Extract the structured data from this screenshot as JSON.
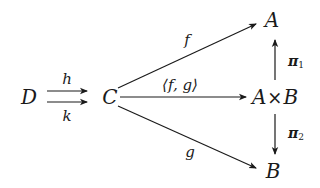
{
  "diagram": {
    "type": "commutative-diagram",
    "nodes": {
      "D": "D",
      "C": "C",
      "A": "A",
      "AxB_left": "A",
      "AxB_times": "×",
      "AxB_right": "B",
      "B": "B"
    },
    "arrows": {
      "h": {
        "from": "D",
        "to": "C",
        "label": "h"
      },
      "k": {
        "from": "D",
        "to": "C",
        "label": "k"
      },
      "f": {
        "from": "C",
        "to": "A",
        "label": "f"
      },
      "pair": {
        "from": "C",
        "to": "A×B",
        "label": "⟨f, g⟩"
      },
      "g": {
        "from": "C",
        "to": "B",
        "label": "g"
      },
      "pi1": {
        "from": "A×B",
        "to": "A",
        "label": "π",
        "sub": "1"
      },
      "pi2": {
        "from": "A×B",
        "to": "B",
        "label": "π",
        "sub": "2"
      }
    },
    "colors": {
      "ink": "#1a1a1a",
      "background": "#ffffff"
    }
  }
}
